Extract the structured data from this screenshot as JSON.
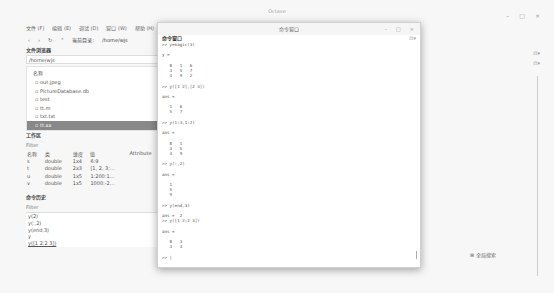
{
  "main_window": {
    "title": "Octave",
    "controls": [
      "–",
      "□",
      "×"
    ],
    "menu": [
      "文件 (F)",
      "编辑 (E)",
      "调试 (D)",
      "窗口 (W)",
      "帮助 (H)",
      "新闻"
    ],
    "toolbar": {
      "icons": [
        "back",
        "forward",
        "refresh",
        "up"
      ],
      "current_dir_label": "当前目录:",
      "current_dir_value": "/home/wjs"
    }
  },
  "file_browser": {
    "title": "文件浏览器",
    "path": "/home/wjs",
    "column_header": "名称",
    "items": [
      {
        "name": "out.jpeg",
        "selected": false
      },
      {
        "name": "PictureDatabase.db",
        "selected": false
      },
      {
        "name": "test",
        "selected": false
      },
      {
        "name": "tt.m",
        "selected": false
      },
      {
        "name": "txt.txt",
        "selected": false
      },
      {
        "name": "tt.xx",
        "selected": true
      }
    ]
  },
  "workspace": {
    "title": "工作区",
    "filter_label": "Filter",
    "columns": [
      "名称",
      "类",
      "维度",
      "值",
      "Attribute"
    ],
    "rows": [
      [
        "s",
        "double",
        "1x4",
        "6:9",
        ""
      ],
      [
        "t",
        "double",
        "2x3",
        "[1, 2, 3;…",
        ""
      ],
      [
        "u",
        "double",
        "1x5",
        "1:200:1…",
        ""
      ],
      [
        "v",
        "double",
        "1x5",
        "1000:-2…",
        ""
      ]
    ]
  },
  "command_history": {
    "title": "命令历史",
    "filter_label": "Filter",
    "items": [
      "y(2)",
      "y(:,2)",
      "y(end,3)",
      "y",
      "y([1 2;2 3])"
    ]
  },
  "command_window": {
    "titlebar": "命令窗口",
    "controls": [
      "–",
      "□",
      "×"
    ],
    "subtitle": "命令窗口",
    "dock_icon": "⊡▾",
    "lines": [
      ">> y=magic(3)",
      "",
      "y =",
      "",
      "   8   1   6",
      "   3   5   7",
      "   4   9   2",
      "",
      ">> y([1 2],[2 3])",
      "",
      "ans =",
      "",
      "   1   6",
      "   5   7",
      "",
      ">> y(1:3,1:2)",
      "",
      "ans =",
      "",
      "   8   1",
      "   3   5",
      "   4   9",
      "",
      ">> y(:,2)",
      "",
      "ans =",
      "",
      "   1",
      "   5",
      "   9",
      "",
      ">> y(end,3)",
      "",
      "ans =  2",
      ">> y([1 2;2 3])",
      "",
      "ans =",
      "",
      "   8   3",
      "   3   4",
      "",
      ">> |"
    ]
  },
  "right_area": {
    "global_search": "⊞ 全局搜索",
    "dock_icon": "⊡▾"
  }
}
